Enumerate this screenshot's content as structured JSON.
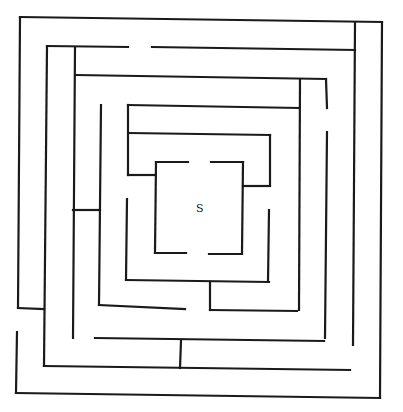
{
  "maze": {
    "start_label": "S",
    "wall_color": "#1a1a1a",
    "background": "#ffffff",
    "walls": [
      [
        20,
        17,
        382,
        22
      ],
      [
        382,
        22,
        380,
        398
      ],
      [
        16,
        393,
        380,
        398
      ],
      [
        17,
        332,
        16,
        393
      ],
      [
        20,
        17,
        18,
        308
      ],
      [
        18,
        308,
        44,
        309
      ],
      [
        47,
        46,
        128,
        47
      ],
      [
        152,
        47,
        355,
        50
      ],
      [
        355,
        22,
        353,
        345
      ],
      [
        47,
        46,
        44,
        366
      ],
      [
        44,
        366,
        350,
        370
      ],
      [
        75,
        47,
        73,
        338
      ],
      [
        76,
        75,
        326,
        79
      ],
      [
        300,
        79,
        299,
        310
      ],
      [
        326,
        79,
        327,
        108
      ],
      [
        327,
        132,
        325,
        338
      ],
      [
        73,
        210,
        100,
        210
      ],
      [
        101,
        105,
        99,
        305
      ],
      [
        99,
        305,
        185,
        309
      ],
      [
        95,
        338,
        324,
        341
      ],
      [
        181,
        341,
        180,
        368
      ],
      [
        128,
        105,
        299,
        108
      ],
      [
        128,
        105,
        128,
        175
      ],
      [
        129,
        133,
        270,
        135
      ],
      [
        270,
        135,
        270,
        185
      ],
      [
        128,
        175,
        155,
        175
      ],
      [
        243,
        186,
        270,
        186
      ],
      [
        156,
        162,
        188,
        162
      ],
      [
        211,
        162,
        243,
        162
      ],
      [
        156,
        162,
        155,
        253
      ],
      [
        243,
        162,
        242,
        253
      ],
      [
        155,
        253,
        186,
        253
      ],
      [
        209,
        254,
        242,
        254
      ],
      [
        127,
        199,
        126,
        280
      ],
      [
        126,
        280,
        269,
        282
      ],
      [
        269,
        210,
        268,
        282
      ],
      [
        210,
        282,
        210,
        310
      ],
      [
        210,
        310,
        297,
        311
      ]
    ],
    "start_position": [
      196,
      212
    ]
  }
}
